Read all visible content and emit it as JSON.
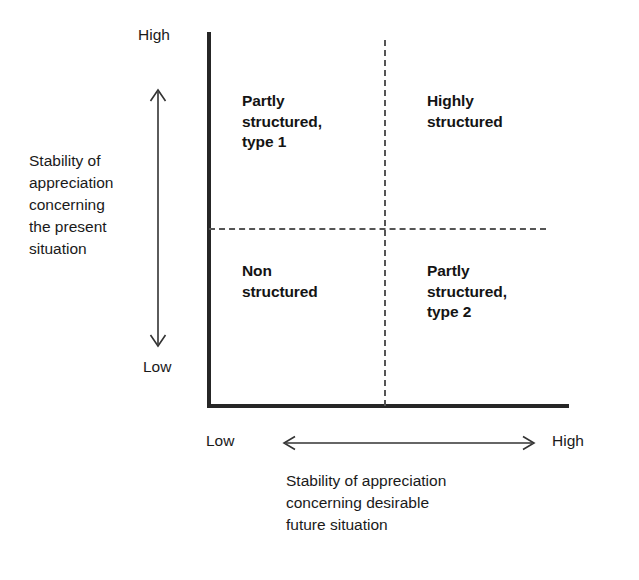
{
  "diagram": {
    "type": "2x2 quadrant matrix",
    "y_axis": {
      "title": "Stability of\nappreciation\nconcerning\nthe present\nsituation",
      "high_label": "High",
      "low_label": "Low",
      "arrow": "double-headed-vertical-arrow"
    },
    "x_axis": {
      "title": "Stability of appreciation\nconcerning desirable\nfuture situation",
      "low_label": "Low",
      "high_label": "High",
      "arrow": "double-headed-horizontal-arrow"
    },
    "quadrants": {
      "top_left": "Partly\nstructured,\ntype 1",
      "top_right": "Highly\nstructured",
      "bottom_left": "Non\nstructured",
      "bottom_right": "Partly\nstructured,\ntype 2"
    },
    "colors": {
      "axis": "#262626",
      "divider": "#555555",
      "text": "#1a1a1a",
      "background": "#ffffff"
    }
  }
}
